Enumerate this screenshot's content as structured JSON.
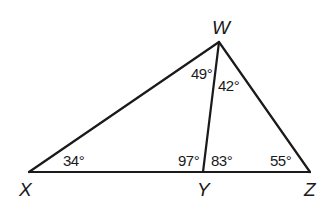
{
  "diagram": {
    "type": "triangle-with-cevian",
    "points": {
      "X": {
        "label": "X",
        "x": 29,
        "y": 172
      },
      "Y": {
        "label": "Y",
        "x": 203,
        "y": 172
      },
      "Z": {
        "label": "Z",
        "x": 310,
        "y": 172
      },
      "W": {
        "label": "W",
        "x": 219,
        "y": 42
      }
    },
    "segments": [
      {
        "from": "X",
        "to": "W",
        "name": "segment-xw"
      },
      {
        "from": "W",
        "to": "Z",
        "name": "segment-wz"
      },
      {
        "from": "X",
        "to": "Z",
        "name": "segment-xz"
      },
      {
        "from": "W",
        "to": "Y",
        "name": "segment-wy"
      }
    ],
    "angles": {
      "angle_X": "34°",
      "angle_XWY": "49°",
      "angle_YWZ": "42°",
      "angle_XYW": "97°",
      "angle_WYZ": "83°",
      "angle_Z": "55°"
    },
    "stroke_color": "#1a1a1a",
    "background_color": "#ffffff"
  }
}
